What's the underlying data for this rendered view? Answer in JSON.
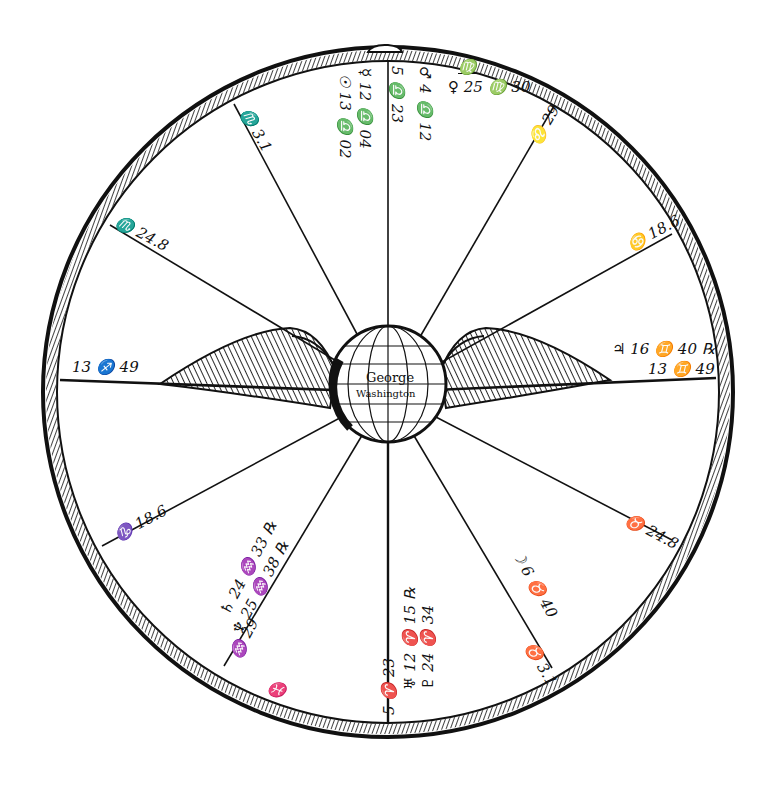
{
  "diagram": {
    "type": "astrological-horoscope-wheel",
    "center_globe": {
      "name_line1": "George",
      "name_line2": "Washington"
    },
    "house_cusps": [
      {
        "position": "ascendant-left",
        "label": "13 ♐ 49"
      },
      {
        "position": "lower-left-1",
        "label": "♑ 18.6"
      },
      {
        "position": "lower-left-2",
        "label": "♓"
      },
      {
        "position": "bottom-ic",
        "label": "5 ♈ 23"
      },
      {
        "position": "lower-right-1",
        "label": "♉ 3.1"
      },
      {
        "position": "lower-right-2",
        "label": "♉ 24.8"
      },
      {
        "position": "descendant-right",
        "label": "13 ♊ 49"
      },
      {
        "position": "upper-right-1",
        "label": "♋ 18.6"
      },
      {
        "position": "upper-right-2",
        "label": "♌ 29"
      },
      {
        "position": "top-mc",
        "label": "5 ♎ 23"
      },
      {
        "position": "upper-left-1",
        "label": "♏ 3.1"
      },
      {
        "position": "upper-left-2",
        "label": "♏ 24.8"
      }
    ],
    "planets": [
      {
        "house": "10",
        "label": "♂ 4 ♎ 12"
      },
      {
        "house": "10",
        "label": "♀ 25 ♍ 30"
      },
      {
        "house": "10",
        "sign_marker": "♍"
      },
      {
        "house": "9",
        "label": "☿ 12 ♎ 04"
      },
      {
        "house": "9",
        "label": "☉ 13 ♎ 02"
      },
      {
        "house": "7",
        "label": "♃ 16 ♊ 40 ℞"
      },
      {
        "house": "5",
        "label": "☽ 6 ♉ 40"
      },
      {
        "house": "4",
        "label": "♅ 12 ♈ 15 ℞"
      },
      {
        "house": "4",
        "label": "♇ 24 ♈ 34"
      },
      {
        "house": "2",
        "label": "♄ 24 ♒ 33 ℞"
      },
      {
        "house": "2",
        "label": "♆ 25 ♒ 38 ℞"
      },
      {
        "house": "2",
        "label": "♒ 29"
      }
    ],
    "colors": {
      "ink": "#111111",
      "paper": "#ffffff"
    }
  }
}
